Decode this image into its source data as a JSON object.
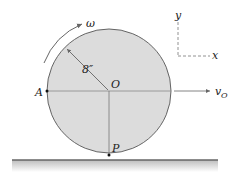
{
  "diagram": {
    "type": "rolling-wheel",
    "labels": {
      "omega": "ω",
      "radius": "8″",
      "center": "O",
      "point_a": "A",
      "point_p": "P",
      "velocity": "v",
      "velocity_sub": "O",
      "axis_x": "x",
      "axis_y": "y"
    },
    "colors": {
      "wheel_fill": "#dcdcdc",
      "wheel_stroke": "#555555",
      "line": "#777777",
      "ground": "#666666",
      "text": "#222222"
    }
  }
}
